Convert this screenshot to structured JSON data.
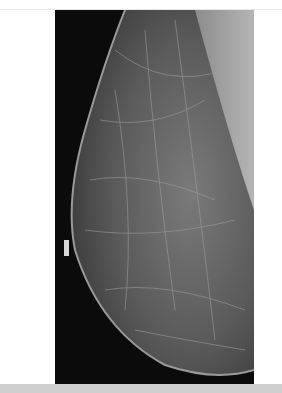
{
  "image": {
    "type": "mammogram",
    "view": "mediolateral oblique",
    "colors": {
      "background": "#0b0b0b",
      "tissue": "#6a6a6a",
      "pectoral": "#a8a8a8",
      "page": "#ffffff",
      "band": "#cfcfcf"
    }
  }
}
